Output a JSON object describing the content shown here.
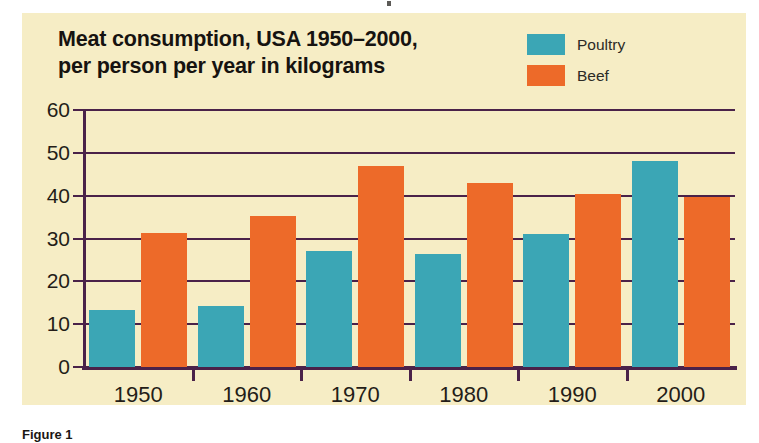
{
  "figure": {
    "caption": "Figure 1"
  },
  "chart_data": {
    "type": "bar",
    "title": "Meat consumption, USA 1950–2000, per person per year in kilograms",
    "title_lines": [
      "Meat consumption, USA 1950–2000,",
      "per person per year in kilograms"
    ],
    "xlabel": "",
    "ylabel": "",
    "categories": [
      "1950",
      "1960",
      "1970",
      "1980",
      "1990",
      "2000"
    ],
    "series": [
      {
        "name": "Poultry",
        "color": "#3ba6b5",
        "values": [
          13.3,
          14.2,
          27.0,
          26.3,
          31.0,
          48.0
        ]
      },
      {
        "name": "Beef",
        "color": "#ed6a29",
        "values": [
          31.2,
          35.2,
          47.0,
          43.0,
          40.5,
          39.7
        ]
      }
    ],
    "ylim": [
      0,
      60
    ],
    "yticks": [
      0,
      10,
      20,
      30,
      40,
      50,
      60
    ],
    "ytick_labels": [
      "0",
      "10",
      "20",
      "30",
      "40",
      "50",
      "60"
    ],
    "grid": true,
    "legend_position": "top-right",
    "background_color": "#f6edc5",
    "axis_color": "#4a2249"
  }
}
